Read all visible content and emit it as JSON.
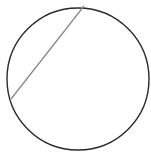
{
  "diagram": {
    "type": "geometry",
    "background": "#ffffff",
    "circle": {
      "cx": 78,
      "cy": 79,
      "r": 71,
      "stroke": "#2a2a2a",
      "stroke_width": 1.4
    },
    "chord": {
      "x1": 84,
      "y1": 6,
      "x2": 11,
      "y2": 99,
      "stroke": "#8a8a8a",
      "stroke_width": 1.3
    }
  }
}
